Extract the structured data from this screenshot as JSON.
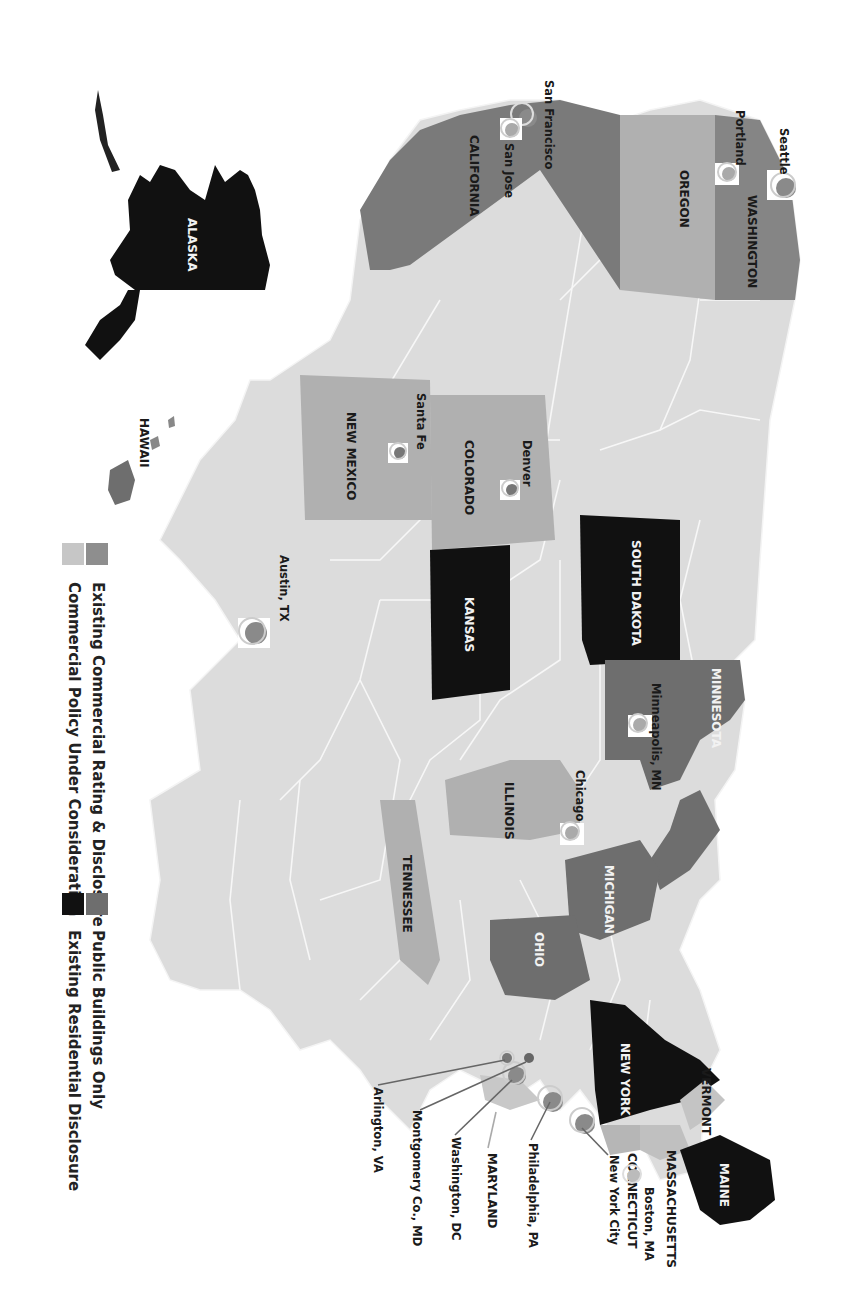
{
  "map": {
    "orientation": "rotated 90deg clockwise",
    "colors": {
      "commercial": "#a9a9a9",
      "public": "#6e6e6e",
      "residential": "#111111",
      "consideration": "#d4d4d4",
      "base": "#dcdcdc",
      "border": "#f4f4f4",
      "marker": "#8a8a8a"
    },
    "states": {
      "washington": "WASHINGTON",
      "oregon": "OREGON",
      "california": "CALIFORNIA",
      "alaska": "ALASKA",
      "hawaii": "HAWAII",
      "new_mexico": "NEW MEXICO",
      "colorado": "COLORADO",
      "kansas": "KANSAS",
      "south_dakota": "SOUTH DAKOTA",
      "minnesota": "MINNESOTA",
      "illinois": "ILLINOIS",
      "michigan": "MICHIGAN",
      "ohio": "OHIO",
      "tennessee": "TENNESSEE",
      "new_york": "NEW YORK",
      "vermont": "VERMONT",
      "maine": "MAINE",
      "massachusetts": "MASSACHUSETTS",
      "connecticut": "CONNECTICUT",
      "maryland": "MARYLAND"
    },
    "cities": {
      "seattle": "Seattle",
      "portland": "Portland",
      "san_francisco": "San Francisco",
      "san_jose": "San Jose",
      "santa_fe": "Santa Fe",
      "denver": "Denver",
      "austin": "Austin, TX",
      "minneapolis": "Minneapolis, MN",
      "chicago": "Chicago",
      "boston": "Boston, MA",
      "new_york_city": "New York City",
      "philadelphia": "Philadelphia, PA",
      "washington_dc": "Washington, DC",
      "montgomery": "Montgomery Co., MD",
      "arlington": "Arlington, VA"
    }
  },
  "legend": {
    "items": [
      {
        "label": "Existing Commercial Rating & Disclosure",
        "color": "#a9a9a9"
      },
      {
        "label": "Commercial Policy Under Consideration",
        "color": "#d4d4d4"
      },
      {
        "label": "Public Buildings Only",
        "color": "#6e6e6e"
      },
      {
        "label": "Existing Residential Disclosure",
        "color": "#111111"
      }
    ]
  }
}
